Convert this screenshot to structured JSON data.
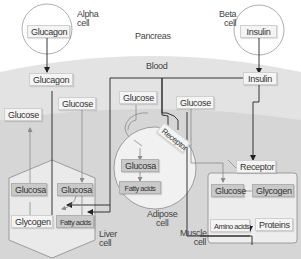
{
  "diagram": {
    "title": "Pancreas",
    "regions": {
      "pancreas": "Pancreas",
      "blood": "Blood"
    },
    "alpha_cell": {
      "label_line1": "Alpha",
      "label_line2": "cell",
      "hormone": "Glucagon"
    },
    "beta_cell": {
      "label_line1": "Beta",
      "label_line2": "cell",
      "hormone": "Insulin"
    },
    "blood_items": {
      "glucagon": "Glucagon",
      "insulin": "Insulin",
      "glucose_left": "Glucose",
      "glucose_liver": "Glucose",
      "glucose_adipose": "Glucose",
      "glucose_muscle": "Glucose"
    },
    "liver_cell": {
      "label_line1": "Liver",
      "label_line2": "cell",
      "glucosa_left": "Glucosa",
      "glucosa_right": "Glucosa",
      "glycogen": "Glycogen",
      "fatty_acids": "Fatty acids"
    },
    "adipose_cell": {
      "label_line1": "Adipose",
      "label_line2": "cell",
      "receptor": "Receptor",
      "glucosa": "Glucosa",
      "fatty_acids": "Fatty acids"
    },
    "muscle_cell": {
      "label_line1": "Muscle",
      "label_line2": "cell",
      "receptor": "Receptor",
      "glucose": "Glucose",
      "glycogen": "Glycogen",
      "amino_acids": "Amino acids",
      "proteins": "Proteins"
    },
    "colors": {
      "background": "#ffffff",
      "blood": "#e3e3e3",
      "tissue": "#d5d5d5",
      "cell_fill": "#f1f1f1",
      "light_box": "#f4f4f4",
      "dark_box": "#c9c9c9",
      "dark_line": "#222222",
      "gray_line": "#8a8a8a"
    }
  }
}
